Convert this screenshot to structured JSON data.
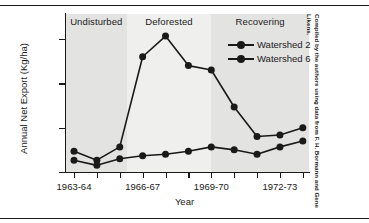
{
  "chart_data": {
    "type": "line",
    "title": "",
    "xlabel": "Year",
    "ylabel": "Annual Net Export (Kg/ha)",
    "ylim": [
      0,
      100
    ],
    "yticks": [
      0,
      30,
      60,
      90
    ],
    "ytick_labels": [
      "0",
      "30",
      "60",
      "90"
    ],
    "grid": false,
    "legend_position": "upper-right",
    "x": [
      "1963-64",
      "1964-65",
      "1965-66",
      "1966-67",
      "1967-68",
      "1968-69",
      "1969-70",
      "1970-71",
      "1971-72",
      "1972-73",
      "1973-74"
    ],
    "xtick_labels": [
      "1963-64",
      "1966-67",
      "1969-70",
      "1972-73"
    ],
    "xtick_label_index": [
      0,
      3,
      6,
      9
    ],
    "n_xticks": 11,
    "series": [
      {
        "name": "Watershed 2",
        "marker": "filled-circle",
        "color": "#1a1a1a",
        "values": [
          14,
          8,
          17,
          78,
          92,
          72,
          69,
          44,
          24,
          25,
          30
        ]
      },
      {
        "name": "Watershed 6",
        "marker": "filled-circle",
        "color": "#1a1a1a",
        "values": [
          8,
          4.5,
          9,
          11,
          12,
          14,
          17,
          15,
          12,
          17,
          21
        ]
      }
    ],
    "zones": [
      {
        "label": "Undisturbed",
        "start_index": 0,
        "end_index": 2.3,
        "fill": "#e3e3e1"
      },
      {
        "label": "Deforested",
        "start_index": 2.3,
        "end_index": 6.0,
        "fill": "#efefee"
      },
      {
        "label": "Recovering",
        "start_index": 6.0,
        "end_index": 10,
        "fill": "#e3e3e1"
      }
    ]
  },
  "credit": {
    "line1": "Compiled by the authors using data from F. H. Bormann and",
    "line2": "Gene Likens."
  },
  "colors": {
    "ink": "#1a1a1a",
    "zone_light": "#efefee",
    "zone_gray": "#e3e3e1",
    "background": "#ffffff"
  }
}
